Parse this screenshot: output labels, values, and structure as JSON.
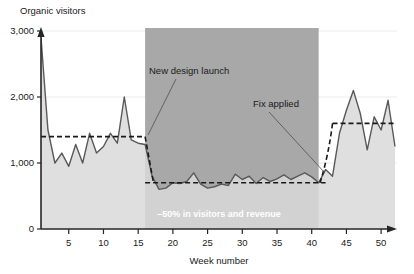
{
  "chart_data": {
    "type": "area",
    "title": "",
    "ylabel": "Organic visitors",
    "xlabel": "Week number",
    "ylim": [
      0,
      3000
    ],
    "xlim": [
      1,
      52
    ],
    "grid": true,
    "legend": "none",
    "y_ticks": [
      "0",
      "1,000",
      "2,000",
      "3,000"
    ],
    "y_tick_values": [
      0,
      1000,
      2000,
      3000
    ],
    "x_ticks": [
      "5",
      "10",
      "15",
      "20",
      "25",
      "30",
      "35",
      "40",
      "45",
      "50"
    ],
    "x_tick_values": [
      5,
      10,
      15,
      20,
      25,
      30,
      35,
      40,
      45,
      50
    ],
    "series": [
      {
        "name": "Organic visitors",
        "x": [
          1,
          2,
          3,
          4,
          5,
          6,
          7,
          8,
          9,
          10,
          11,
          12,
          13,
          14,
          15,
          16,
          17,
          18,
          19,
          20,
          21,
          22,
          23,
          24,
          25,
          26,
          27,
          28,
          29,
          30,
          31,
          32,
          33,
          34,
          35,
          36,
          37,
          38,
          39,
          40,
          41,
          42,
          43,
          44,
          45,
          46,
          47,
          48,
          49,
          50,
          51,
          52
        ],
        "values": [
          2900,
          1500,
          1000,
          1150,
          950,
          1280,
          1000,
          1450,
          1150,
          1250,
          1450,
          1300,
          2000,
          1350,
          1300,
          1280,
          800,
          600,
          620,
          700,
          690,
          720,
          850,
          680,
          620,
          640,
          680,
          660,
          830,
          750,
          800,
          690,
          780,
          720,
          760,
          820,
          750,
          800,
          850,
          790,
          700,
          900,
          800,
          1450,
          1800,
          2100,
          1750,
          1200,
          1700,
          1500,
          1950,
          1250
        ]
      }
    ],
    "reference_lines": [
      {
        "name": "pre-launch average",
        "value": 1400,
        "x_start": 1,
        "x_end": 16,
        "style": "dashed"
      },
      {
        "name": "post-launch average",
        "value": 700,
        "x_start": 16,
        "x_end": 42,
        "style": "dashed"
      },
      {
        "name": "post-fix average",
        "value": 1600,
        "x_start": 43,
        "x_end": 52,
        "style": "dashed"
      }
    ],
    "annotations": [
      {
        "name": "new-design-launch",
        "text": "New design launch",
        "target_week": 16
      },
      {
        "name": "fix-applied",
        "text": "Fix applied",
        "target_week": 42
      }
    ],
    "shaded_regions": [
      {
        "name": "impact-band",
        "label": "–50% in visitors and revenue",
        "x_start": 16,
        "x_end": 41,
        "color": "#a8a8a8"
      }
    ],
    "colors": {
      "area_fill": "#d9d9d9",
      "line": "#595959",
      "band_fill": "#a8a8a8",
      "axis": "#262626",
      "grid": "#e8e8e8",
      "band_text": "#ffffff"
    }
  }
}
